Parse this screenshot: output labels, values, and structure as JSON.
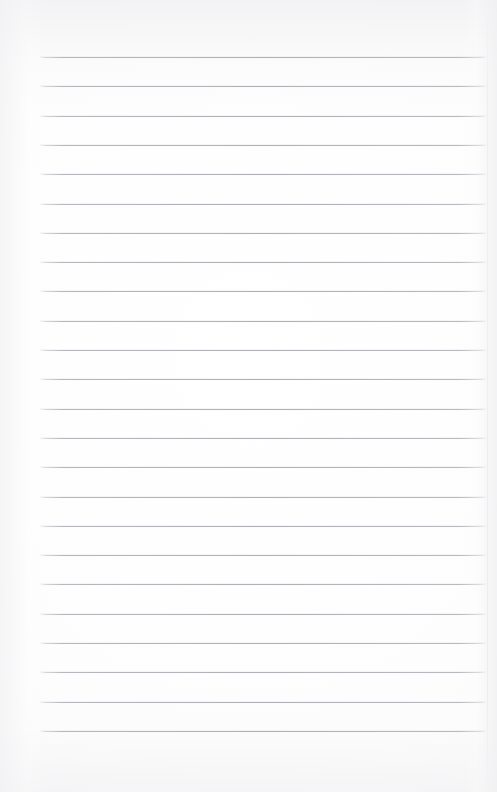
{
  "document": {
    "kind": "blank-lined-page",
    "title": "Blank ruled notebook page",
    "text_content": "",
    "has_text": false,
    "has_margin_rule": false,
    "has_header": false,
    "has_page_number": false
  },
  "canvas": {
    "width": 497,
    "height": 792,
    "background_color": "#fdfdfd",
    "paper_tint_color": "#f6f6f7",
    "sheet_edge_color": "#e8e8eb"
  },
  "ruling": {
    "line_color": "#acaeb4",
    "line_thickness_px": 1,
    "line_count": 24,
    "first_line_y": 57,
    "line_spacing_px": 29.3,
    "line_start_x": 40,
    "line_end_x": 486,
    "margin_left_px": 40,
    "margin_right_px": 11,
    "margin_top_px": 57,
    "margin_bottom_px": 60,
    "line_y_positions": [
      57,
      86.3,
      115.6,
      144.9,
      174.2,
      203.5,
      232.8,
      262.1,
      291.4,
      320.7,
      350,
      379.3,
      408.6,
      437.9,
      467.2,
      496.5,
      525.8,
      555.1,
      584.4,
      613.7,
      643,
      672.3,
      701.6,
      730.9
    ],
    "sheet_edge_x": 487
  }
}
